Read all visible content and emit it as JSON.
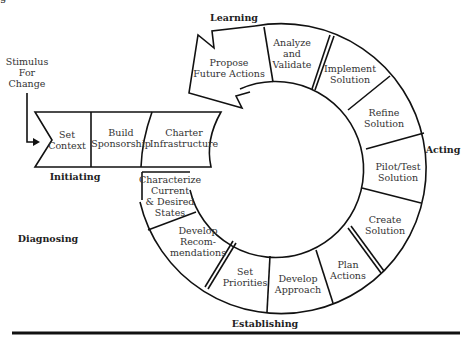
{
  "corner_text": "g",
  "stimulus": {
    "line1": "Stimulus",
    "line2": "For",
    "line3": "Change"
  },
  "phases": {
    "initiating": "Initiating",
    "diagnosing": "Diagnosing",
    "establishing": "Establishing",
    "acting": "Acting",
    "learning": "Learning"
  },
  "steps": {
    "set_context": {
      "l1": "Set",
      "l2": "Context"
    },
    "build_sponsorship": {
      "l1": "Build",
      "l2": "Sponsorship"
    },
    "charter_infrastructure": {
      "l1": "Charter",
      "l2": "Infrastructure"
    },
    "characterize_states": {
      "l1": "Characterize",
      "l2": "Current",
      "l3": "& Desired",
      "l4": "States"
    },
    "develop_recommendations": {
      "l1": "Develop",
      "l2": "Recom-",
      "l3": "mendations"
    },
    "set_priorities": {
      "l1": "Set",
      "l2": "Priorities"
    },
    "develop_approach": {
      "l1": "Develop",
      "l2": "Approach"
    },
    "plan_actions": {
      "l1": "Plan",
      "l2": "Actions"
    },
    "create_solution": {
      "l1": "Create",
      "l2": "Solution"
    },
    "pilot_test_solution": {
      "l1": "Pilot/Test",
      "l2": "Solution"
    },
    "refine_solution": {
      "l1": "Refine",
      "l2": "Solution"
    },
    "implement_solution": {
      "l1": "Implement",
      "l2": "Solution"
    },
    "analyze_validate": {
      "l1": "Analyze",
      "l2": "and",
      "l3": "Validate"
    },
    "propose_future_actions": {
      "l1": "Propose",
      "l2": "Future Actions"
    }
  }
}
